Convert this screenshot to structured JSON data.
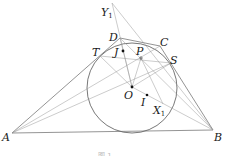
{
  "figure": {
    "caption": "图 1",
    "points": {
      "A": {
        "label": "A",
        "x": 12,
        "y": 133
      },
      "B": {
        "label": "B",
        "x": 213,
        "y": 130
      },
      "C": {
        "label": "C",
        "x": 160,
        "y": 46
      },
      "D": {
        "label": "D",
        "x": 120,
        "y": 38
      },
      "T": {
        "label": "T",
        "x": 100,
        "y": 56
      },
      "S": {
        "label": "S",
        "x": 171,
        "y": 63
      },
      "P": {
        "label": "P",
        "x": 141,
        "y": 58
      },
      "J": {
        "label": "J",
        "x": 123,
        "y": 51
      },
      "O": {
        "label": "O",
        "x": 132,
        "y": 87
      },
      "I": {
        "label": "I",
        "x": 147,
        "y": 95
      },
      "X1": {
        "label": "X",
        "sub": "1",
        "x": 163,
        "y": 104
      },
      "Y1": {
        "label": "Y",
        "sub": "1",
        "x": 112,
        "y": 3
      }
    },
    "circle": {
      "cx": 132,
      "cy": 88,
      "r": 45
    }
  }
}
